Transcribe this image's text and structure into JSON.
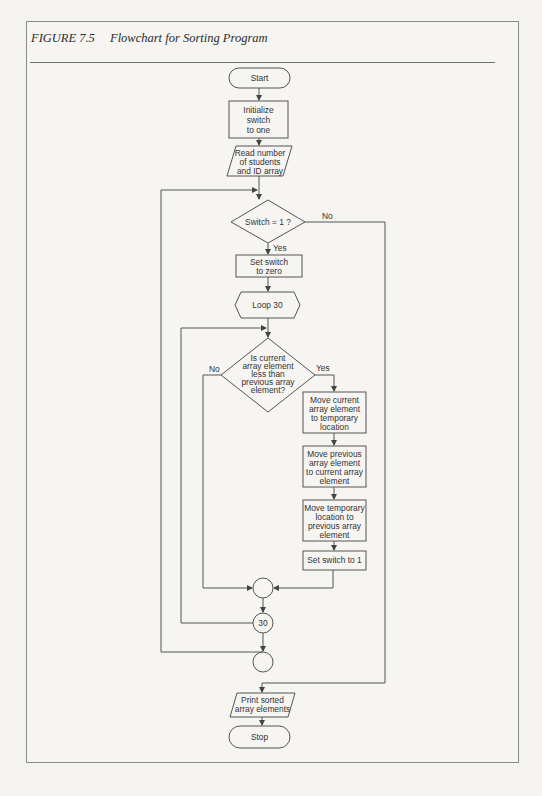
{
  "figure": {
    "number": "FIGURE 7.5",
    "title": "Flowchart for Sorting Program"
  },
  "nodes": {
    "start": "Start",
    "init": [
      "Initialize",
      "switch",
      "to one"
    ],
    "read": [
      "Read number",
      "of students",
      "and ID array"
    ],
    "decision_switch": "Switch = 1 ?",
    "set_zero": [
      "Set switch",
      "to zero"
    ],
    "loop": "Loop 30",
    "decision_compare": [
      "Is current",
      "array element",
      "less than",
      "previous array",
      "element?"
    ],
    "move1": [
      "Move current",
      "array element",
      "to temporary",
      "location"
    ],
    "move2": [
      "Move previous",
      "array element",
      "to current array",
      "element"
    ],
    "move3": [
      "Move temporary",
      "location to",
      "previous array",
      "element"
    ],
    "set_one": "Set switch to 1",
    "connector_30": "30",
    "print": [
      "Print sorted",
      "array elements"
    ],
    "stop": "Stop"
  },
  "edge_labels": {
    "switch_no": "No",
    "switch_yes": "Yes",
    "compare_no": "No",
    "compare_yes": "Yes"
  }
}
